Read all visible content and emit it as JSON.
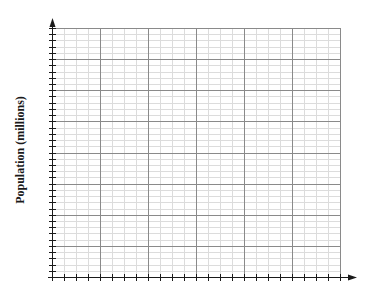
{
  "chart_data": {
    "type": "line",
    "title": "",
    "xlabel": "",
    "ylabel": "Population (millions)",
    "series": [],
    "grid": true,
    "legend": null,
    "x_major_divisions": 6,
    "x_minor_per_major": 4,
    "y_major_divisions": 8,
    "y_minor_per_major": 5,
    "tick_labels_x": [],
    "tick_labels_y": []
  },
  "layout": {
    "origin_x": 52,
    "origin_y": 277,
    "grid_right": 340,
    "grid_top": 28,
    "axis_x_end": 357,
    "axis_y_end": 18
  },
  "colors": {
    "axis": "#1a1a1a",
    "major_grid": "#8a8a8a",
    "minor_grid": "#dcdcdc",
    "label": "#1a1a1a"
  }
}
